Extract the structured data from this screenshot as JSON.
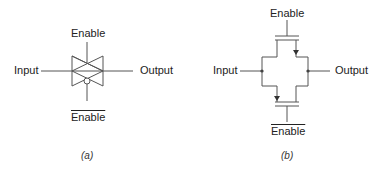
{
  "diagram_a": {
    "caption": "(a)",
    "input_label": "Input",
    "output_label": "Output",
    "enable_label": "Enable",
    "enable_bar_label": "Enable",
    "symbol": "transmission-gate"
  },
  "diagram_b": {
    "caption": "(b)",
    "input_label": "Input",
    "output_label": "Output",
    "enable_label": "Enable",
    "enable_bar_label": "Enable",
    "symbol": "cmos-transmission-gate-transistors"
  },
  "colors": {
    "line": "#555555",
    "text": "#222222"
  }
}
